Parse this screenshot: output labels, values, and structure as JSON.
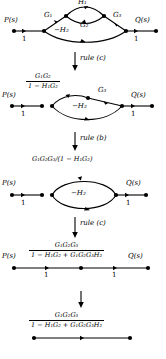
{
  "figure": {
    "type": "signal-flow-graph-reduction",
    "symbols": {
      "input": "P(s)",
      "output": "Q(s)",
      "unit_gain": "1",
      "G1": "G₁",
      "G2": "G₂",
      "G3": "G₃",
      "H1": "H₁",
      "H2": "−H₂"
    },
    "stages": [
      {
        "id": "stage-1",
        "input_label": "P(s)",
        "output_label": "Q(s)",
        "input_gain": "1",
        "output_gain": "1",
        "branch_labels": [
          "G₁",
          "H₁",
          "G₂",
          "G₃",
          "−H₂"
        ]
      },
      {
        "id": "stage-2",
        "input_label": "P(s)",
        "output_label": "Q(s)",
        "input_gain": "1",
        "output_gain": "1",
        "fraction": {
          "numerator": "G₁G₂",
          "denominator": "1 − H₁G₂"
        },
        "branch_labels": [
          "G₃",
          "−H₂"
        ]
      },
      {
        "id": "stage-3",
        "input_label": "P(s)",
        "output_label": "Q(s)",
        "input_gain": "1",
        "output_gain": "1",
        "expression": "G₁G₂G₃/(1 − H₁G₂)",
        "branch_labels": [
          "−H₂"
        ]
      },
      {
        "id": "stage-4",
        "input_label": "P(s)",
        "output_label": "Q(s)",
        "input_gain": "1",
        "output_gain": "1",
        "fraction": {
          "numerator": "G₁G₂G₃",
          "denominator": "1 − H₁G₂ + G₁G₂G₃H₂"
        }
      },
      {
        "id": "stage-5",
        "fraction": {
          "numerator": "G₁G₂G₃",
          "denominator": "1 − H₁G₂ + G₁G₂G₃H₂"
        }
      }
    ],
    "transitions": [
      {
        "id": "transition-1",
        "label": "rule (c)"
      },
      {
        "id": "transition-2",
        "label": "rule (b)"
      },
      {
        "id": "transition-3",
        "label": "rule (c)"
      }
    ],
    "colors": {
      "ink": "#000000",
      "background": "#ffffff"
    }
  }
}
